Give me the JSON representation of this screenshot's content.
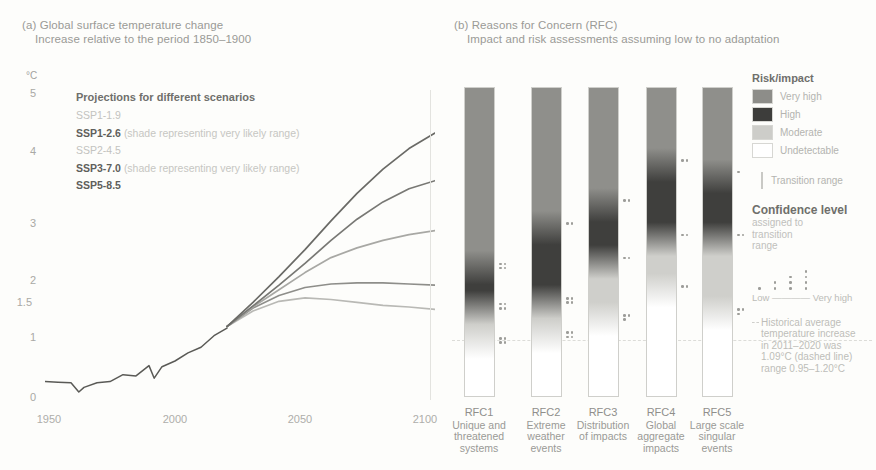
{
  "panel_a": {
    "label": "(a)",
    "title": "Global surface temperature change",
    "subtitle": "Increase relative to the period 1850–1900",
    "unit": "°C",
    "legend_title": "Projections for different scenarios",
    "scenarios": [
      {
        "name": "SSP1-1.9",
        "note": "",
        "emphasis": "faint",
        "color": "#b9b9b5"
      },
      {
        "name": "SSP1-2.6",
        "note": "(shade representing very likely range)",
        "emphasis": "bold",
        "color": "#8e8e8a"
      },
      {
        "name": "SSP2-4.5",
        "note": "",
        "emphasis": "faint",
        "color": "#a8a8a4"
      },
      {
        "name": "SSP3-7.0",
        "note": "(shade representing very likely range)",
        "emphasis": "bold",
        "color": "#787874"
      },
      {
        "name": "SSP5-8.5",
        "note": "",
        "emphasis": "bold",
        "color": "#6a6a66"
      }
    ]
  },
  "panel_b": {
    "label": "(b)",
    "title": "Reasons for Concern (RFC)",
    "subtitle": "Impact and risk assessments assuming low to no adaptation",
    "rfcs": [
      {
        "code": "RFC1",
        "name": "Unique and threatened systems"
      },
      {
        "code": "RFC2",
        "name": "Extreme weather events"
      },
      {
        "code": "RFC3",
        "name": "Distribution of impacts"
      },
      {
        "code": "RFC4",
        "name": "Global aggregate impacts"
      },
      {
        "code": "RFC5",
        "name": "Large scale singular events"
      }
    ]
  },
  "legend_b": {
    "risk_title": "Risk/impact",
    "risk_levels": [
      {
        "label": "Very high",
        "color": "#8d8d89"
      },
      {
        "label": "High",
        "color": "#3d3d3b"
      },
      {
        "label": "Moderate",
        "color": "#cdcdc9"
      },
      {
        "label": "Undetectable",
        "color": "#ffffff"
      }
    ],
    "transition_label": "Transition range",
    "confidence_title": "Confidence level",
    "confidence_sub_1": "assigned to",
    "confidence_sub_2": "transition",
    "confidence_sub_3": "range",
    "confidence_low": "Low",
    "confidence_high": "Very high",
    "confidence_counts": [
      1,
      2,
      3,
      4
    ],
    "hist_note_1": "Historical average",
    "hist_note_2": "temperature increase",
    "hist_note_3": "in 2011–2020 was",
    "hist_note_4": "1.09°C (dashed line)",
    "hist_note_5": "range 0.95–1.20°C"
  },
  "chart_data": [
    {
      "type": "line",
      "title": "Global surface temperature change",
      "subtitle": "Increase relative to the period 1850–1900",
      "xlabel": "",
      "ylabel": "°C",
      "xlim": [
        1950,
        2100
      ],
      "ylim": [
        -0.2,
        5.2
      ],
      "xticks": [
        1950,
        2000,
        2050,
        2100
      ],
      "yticks": [
        0,
        1,
        1.5,
        2,
        3,
        4,
        5
      ],
      "grid": false,
      "legend_position": "inside-top-left",
      "series": [
        {
          "name": "Historical",
          "color": "#5a5a56",
          "x": [
            1950,
            1955,
            1960,
            1963,
            1965,
            1970,
            1975,
            1980,
            1985,
            1990,
            1992,
            1995,
            2000,
            2005,
            2010,
            2015,
            2020
          ],
          "values": [
            0.12,
            0.11,
            0.1,
            -0.06,
            0.02,
            0.1,
            0.12,
            0.24,
            0.22,
            0.4,
            0.18,
            0.38,
            0.48,
            0.62,
            0.72,
            0.92,
            1.05
          ]
        },
        {
          "name": "SSP1-1.9",
          "color": "#b9b9b5",
          "x": [
            2020,
            2030,
            2040,
            2050,
            2060,
            2070,
            2080,
            2090,
            2100
          ],
          "values": [
            1.08,
            1.35,
            1.52,
            1.58,
            1.55,
            1.5,
            1.45,
            1.42,
            1.38
          ]
        },
        {
          "name": "SSP1-2.6",
          "color": "#8e8e8a",
          "x": [
            2020,
            2030,
            2040,
            2050,
            2060,
            2070,
            2080,
            2090,
            2100
          ],
          "values": [
            1.08,
            1.4,
            1.62,
            1.76,
            1.82,
            1.84,
            1.84,
            1.82,
            1.8
          ]
        },
        {
          "name": "SSP2-4.5",
          "color": "#a8a8a4",
          "x": [
            2020,
            2030,
            2040,
            2050,
            2060,
            2070,
            2080,
            2090,
            2100
          ],
          "values": [
            1.08,
            1.42,
            1.72,
            2.02,
            2.28,
            2.45,
            2.58,
            2.68,
            2.75
          ]
        },
        {
          "name": "SSP3-7.0",
          "color": "#787874",
          "x": [
            2020,
            2030,
            2040,
            2050,
            2060,
            2070,
            2080,
            2090,
            2100
          ],
          "values": [
            1.08,
            1.44,
            1.8,
            2.18,
            2.58,
            2.95,
            3.25,
            3.48,
            3.62
          ]
        },
        {
          "name": "SSP5-8.5",
          "color": "#6a6a66",
          "x": [
            2020,
            2030,
            2040,
            2050,
            2060,
            2070,
            2080,
            2090,
            2100
          ],
          "values": [
            1.08,
            1.5,
            1.95,
            2.42,
            2.92,
            3.4,
            3.82,
            4.18,
            4.45
          ]
        }
      ]
    },
    {
      "type": "heatmap",
      "title": "Reasons for Concern (RFC)",
      "subtitle": "Impact and risk assessments assuming low to no adaptation",
      "ylabel": "°C",
      "ylim": [
        -0.2,
        5.2
      ],
      "categories": [
        "RFC1",
        "RFC2",
        "RFC3",
        "RFC4",
        "RFC5"
      ],
      "historical_line": 1.09,
      "bars": [
        {
          "code": "RFC1",
          "name": "Unique and threatened systems",
          "transitions": [
            {
              "from": "Undetectable",
              "to": "Moderate",
              "center": 0.75,
              "confidence": 4
            },
            {
              "from": "Moderate",
              "to": "High",
              "center": 1.35,
              "confidence": 4
            },
            {
              "from": "High",
              "to": "Very high",
              "center": 2.05,
              "confidence": 4
            }
          ]
        },
        {
          "code": "RFC2",
          "name": "Extreme weather events",
          "transitions": [
            {
              "from": "Undetectable",
              "to": "Moderate",
              "center": 0.85,
              "confidence": 4
            },
            {
              "from": "Moderate",
              "to": "High",
              "center": 1.45,
              "confidence": 4
            },
            {
              "from": "High",
              "to": "Very high",
              "center": 2.75,
              "confidence": 2
            }
          ]
        },
        {
          "code": "RFC3",
          "name": "Distribution of impacts",
          "transitions": [
            {
              "from": "Undetectable",
              "to": "Moderate",
              "center": 1.15,
              "confidence": 3
            },
            {
              "from": "Moderate",
              "to": "High",
              "center": 2.15,
              "confidence": 2
            },
            {
              "from": "High",
              "to": "Very high",
              "center": 3.15,
              "confidence": 2
            }
          ]
        },
        {
          "code": "RFC4",
          "name": "Global aggregate impacts",
          "transitions": [
            {
              "from": "Undetectable",
              "to": "Moderate",
              "center": 1.65,
              "confidence": 2
            },
            {
              "from": "Moderate",
              "to": "High",
              "center": 2.55,
              "confidence": 2
            },
            {
              "from": "High",
              "to": "Very high",
              "center": 3.85,
              "confidence": 2
            }
          ]
        },
        {
          "code": "RFC5",
          "name": "Large scale singular events",
          "transitions": [
            {
              "from": "Undetectable",
              "to": "Moderate",
              "center": 1.25,
              "confidence": 3
            },
            {
              "from": "Moderate",
              "to": "High",
              "center": 2.55,
              "confidence": 2
            },
            {
              "from": "High",
              "to": "Very high",
              "center": 3.65,
              "confidence": 1
            }
          ]
        }
      ]
    }
  ]
}
